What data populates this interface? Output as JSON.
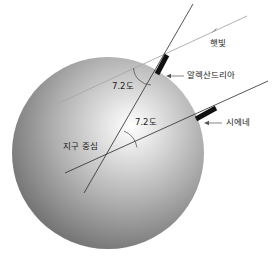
{
  "diagram": {
    "type": "eratosthenes-earth-circumference",
    "labels": {
      "sunlight": "햇빛",
      "alexandria": "알렉산드리아",
      "syene": "시에네",
      "angle_top": "7.2도",
      "angle_center": "7.2도",
      "earth_center": "지구 중심"
    },
    "colors": {
      "sphere_highlight": "#ffffff",
      "sphere_mid": "#b5b5b5",
      "sphere_edge": "#6e6e6e",
      "line": "#2a2a2a",
      "sunlight_ray": "#a8a8a8",
      "obelisk": "#111111"
    }
  }
}
